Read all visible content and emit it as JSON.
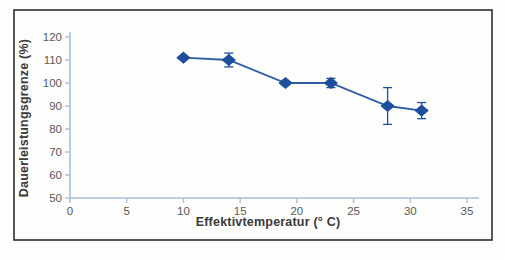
{
  "figure": {
    "background": "#fdfdfb",
    "frame_color": "#2e2e2e"
  },
  "chart_data": {
    "type": "line",
    "title": "",
    "xlabel": "Effektivtemperatur (° C)",
    "ylabel": "Dauerleistungsgrenze (%)",
    "xlim": [
      0,
      35
    ],
    "ylim": [
      50,
      120
    ],
    "xticks": [
      0,
      5,
      10,
      15,
      20,
      25,
      30,
      35
    ],
    "yticks": [
      50,
      60,
      70,
      80,
      90,
      100,
      110,
      120
    ],
    "grid": false,
    "legend_position": "none",
    "series": [
      {
        "name": "Dauerleistungsgrenze",
        "x": [
          10,
          14,
          19,
          23,
          28,
          31
        ],
        "y": [
          111,
          110,
          100,
          100,
          90,
          88
        ],
        "yerr": [
          0,
          3,
          0,
          2,
          8,
          3.5
        ],
        "marker": "diamond",
        "line_color": "#2e5da6",
        "marker_color": "#1d4f9c",
        "errorbar_color": "#1d4f9c"
      }
    ],
    "axis_color": "#a7bedb",
    "tick_label_color": "#595959",
    "axis_label_color": "#3a3a3a"
  }
}
